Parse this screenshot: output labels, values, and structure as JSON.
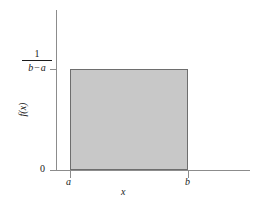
{
  "figure": {
    "background_color": "#ffffff",
    "axis_color": "#8c8c8c",
    "fill_color": "#c8c8c8",
    "stroke_color": "#6e6e6e",
    "text_color": "#1a1a1a"
  },
  "labels": {
    "y_tick_top_numerator": "1",
    "y_tick_top_denominator_left": "b",
    "y_tick_top_denominator_op": "−",
    "y_tick_top_denominator_right": "a",
    "y_tick_zero": "0",
    "x_tick_a": "a",
    "x_tick_b": "b",
    "x_axis_title": "x",
    "y_axis_title": "f(x)"
  },
  "chart_data": {
    "type": "area",
    "title": "",
    "subtitle": "",
    "xlabel": "x",
    "ylabel": "f(x)",
    "grid": false,
    "legend": "none",
    "annotations": [],
    "x_tick_labels": [
      "a",
      "b"
    ],
    "y_tick_labels": [
      "0",
      "1/(b − a)"
    ],
    "xlim": [
      "below a",
      "beyond b"
    ],
    "ylim": [
      0,
      "1/(b - a)"
    ],
    "series": [
      {
        "name": "uniform probability density",
        "x": [
          "a",
          "b"
        ],
        "values": [
          "1/(b - a)",
          "1/(b - a)"
        ],
        "baseline": 0
      }
    ]
  }
}
